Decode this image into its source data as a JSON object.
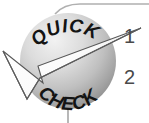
{
  "figure": {
    "title_top": "QUICK",
    "title_bottom": "CHECK",
    "badge_shape": "circle-sphere",
    "overlay_icon": "checkmark-icon",
    "colors": {
      "badge_light": "#e8e8e8",
      "badge_mid": "#b8b8b8",
      "badge_dark": "#8f8f8f",
      "text": "#1a1a1a",
      "callout": "#9a9a9a",
      "number": "#4a4a4a",
      "background": "#ffffff"
    }
  },
  "callouts": [
    {
      "id": "1",
      "label": "1",
      "leader": "line-from-badge-upper-right"
    },
    {
      "id": "2",
      "label": "2",
      "leader": "none"
    }
  ],
  "guides": [
    {
      "name": "top-curve-line",
      "orientation": "horizontal-curved"
    },
    {
      "name": "bottom-stem-line",
      "orientation": "vertical"
    }
  ]
}
